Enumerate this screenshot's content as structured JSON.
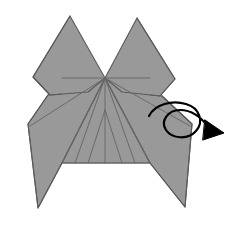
{
  "figure": {
    "domain": "Diagram",
    "kind": "origami-folding-step-diagram",
    "title": "",
    "caption": "",
    "canvas": {
      "width": 237,
      "height": 225,
      "background": "#ffffff"
    },
    "colors": {
      "paper_fill": "#999999",
      "paper_stroke": "#5a5a5a",
      "crease_line": "#6a6a6a",
      "symbol_stroke": "#000000",
      "background": "#ffffff"
    },
    "stroke_widths": {
      "outline": 1.1,
      "crease": 1.0,
      "symbol": 2.2
    }
  },
  "shapes": {
    "left_ear": {
      "name": "left-ear-flap",
      "points": "70,16 33,77 50,95 88,92 105,78"
    },
    "right_ear": {
      "name": "right-ear-flap",
      "points": "137,18 175,79 160,96 122,92 105,78"
    },
    "left_wing": {
      "name": "left-wing-flap",
      "points": "105,78 62,163 38,208 28,124 48,95"
    },
    "right_wing": {
      "name": "right-wing-flap",
      "points": "105,78 150,163 185,207 192,124 162,96"
    },
    "center_body": {
      "name": "center-body-panel",
      "points": "105,78 150,163 62,163"
    },
    "body_top_left": {
      "name": "body-top-left-edge",
      "points": "105,78 62,78 62,163"
    },
    "body_top_right": {
      "name": "body-top-right-edge",
      "points": "105,78 150,78 150,163"
    }
  },
  "creases": {
    "apex": {
      "x": 105,
      "y": 78
    },
    "secondary_junction": {
      "x": 105,
      "y": 110
    },
    "bottom_y": 163,
    "rays_from_apex": [
      {
        "name": "crease-ray-far-left",
        "x2": 30,
        "y2": 126
      },
      {
        "name": "crease-ray-left-outer",
        "x2": 62,
        "y2": 163
      },
      {
        "name": "crease-ray-left-mid",
        "x2": 75,
        "y2": 163
      },
      {
        "name": "crease-ray-center",
        "x2": 105,
        "y2": 163
      },
      {
        "name": "crease-ray-right-mid",
        "x2": 135,
        "y2": 163
      },
      {
        "name": "crease-ray-right-outer",
        "x2": 150,
        "y2": 163
      },
      {
        "name": "crease-ray-far-right",
        "x2": 190,
        "y2": 126
      }
    ],
    "rays_from_junction": [
      {
        "name": "junction-ray-left",
        "x2": 88,
        "y2": 163
      },
      {
        "name": "junction-ray-right",
        "x2": 122,
        "y2": 163
      }
    ],
    "horizontal_top": {
      "name": "apex-horizontal-crease",
      "x1": 62,
      "y1": 78,
      "x2": 150,
      "y2": 78
    },
    "horizontal_bottom": {
      "name": "body-bottom-crease",
      "x1": 62,
      "y1": 163,
      "x2": 150,
      "y2": 163
    }
  },
  "symbols": {
    "turn_over_arrow": {
      "name": "turn-over-arrow",
      "label": "turn over",
      "tail_path": "M 149,116 C 155,104 172,100 186,104",
      "loop_path": "M 186,104 C 200,108 204,122 196,131 C 188,140 172,139 166,130 C 160,121 168,110 180,110 C 192,110 202,118 209,128",
      "arrow_tip": {
        "x": 221,
        "y": 134
      },
      "arrow_head_points": "205,120 224,133 203,140"
    }
  },
  "meta": {
    "visible_text": []
  }
}
